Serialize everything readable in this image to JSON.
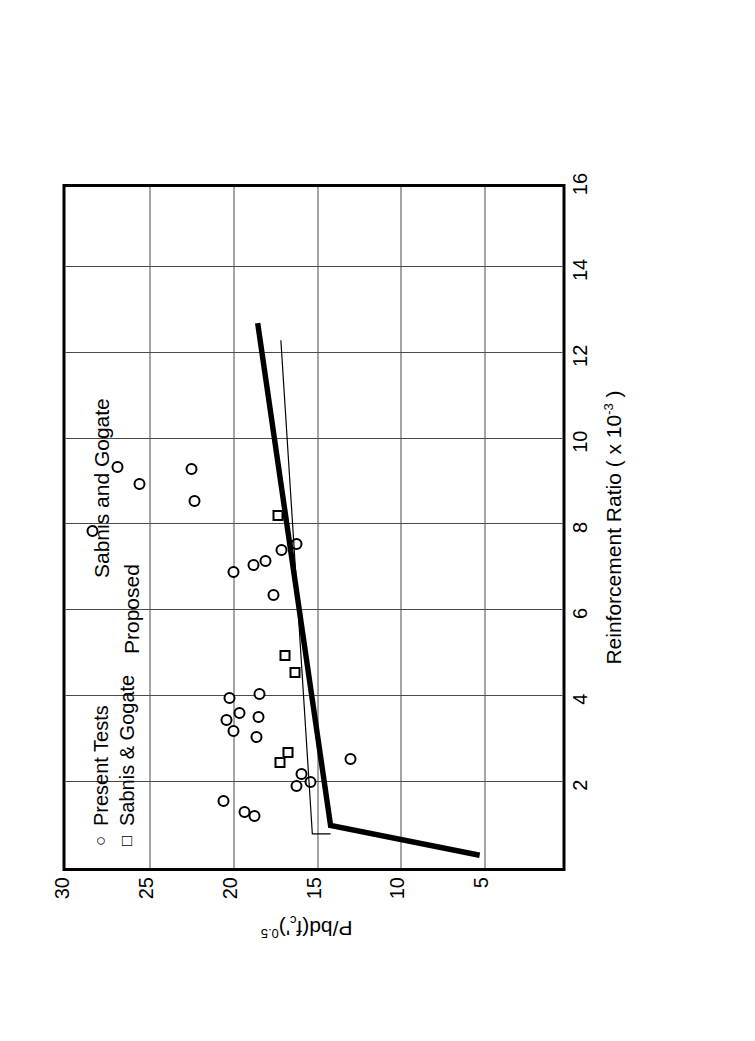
{
  "figure": {
    "orientation": "rotated-90-ccw"
  },
  "chart_data": {
    "type": "scatter",
    "title": "",
    "xlabel": "Reinforcement Ratio ( x 10",
    "xlabel_exponent": "-3",
    "xlabel_tail": " )",
    "ylabel": "P/bd(f",
    "ylabel_sub": "c",
    "ylabel_prime": "'",
    "ylabel_tail": ")",
    "ylabel_exp": "0.5",
    "xlim": [
      0,
      16
    ],
    "ylim": [
      0,
      30
    ],
    "xticks": [
      2,
      4,
      6,
      8,
      10,
      12,
      14,
      16
    ],
    "yticks": [
      5,
      10,
      15,
      20,
      25,
      30
    ],
    "grid": true,
    "legend_position": "top-left-inside",
    "series": [
      {
        "name": "Present Tests",
        "marker": "circle",
        "points": [
          [
            1.55,
            20.6
          ],
          [
            1.3,
            19.3
          ],
          [
            1.2,
            18.7
          ],
          [
            1.92,
            16.2
          ],
          [
            2.2,
            15.9
          ],
          [
            2.0,
            15.4
          ],
          [
            2.55,
            13.0
          ],
          [
            3.05,
            18.6
          ],
          [
            3.2,
            20.0
          ],
          [
            3.45,
            20.4
          ],
          [
            3.52,
            18.5
          ],
          [
            3.62,
            19.6
          ],
          [
            3.95,
            20.2
          ],
          [
            4.05,
            18.4
          ],
          [
            6.35,
            17.6
          ],
          [
            6.9,
            20.0
          ],
          [
            7.05,
            18.8
          ],
          [
            7.15,
            18.1
          ],
          [
            7.4,
            17.1
          ],
          [
            7.55,
            16.2
          ],
          [
            7.85,
            28.4
          ],
          [
            8.55,
            22.3
          ],
          [
            8.95,
            25.6
          ],
          [
            9.35,
            26.9
          ],
          [
            9.3,
            22.5
          ]
        ]
      },
      {
        "name": "Sabnis & Gogate",
        "marker": "square",
        "points": [
          [
            2.45,
            17.2
          ],
          [
            2.7,
            16.7
          ],
          [
            4.55,
            16.3
          ],
          [
            4.95,
            16.9
          ],
          [
            8.2,
            17.3
          ]
        ]
      }
    ],
    "lines": [
      {
        "name": "Proposed",
        "style": "thick-solid",
        "label": "Proposed",
        "vertices": [
          [
            0.3,
            5.0
          ],
          [
            1.0,
            14.0
          ],
          [
            12.8,
            18.4
          ]
        ]
      },
      {
        "name": "Sabnis and Gogate",
        "style": "thin-solid",
        "label": "Sabnis and Gogate",
        "vertices": [
          [
            0.8,
            14.0
          ],
          [
            0.8,
            15.1
          ],
          [
            12.4,
            17.0
          ]
        ]
      }
    ]
  },
  "legend": {
    "items": [
      {
        "marker": "○",
        "label": "Present Tests"
      },
      {
        "marker": "□",
        "label": "Sabnis & Gogate"
      }
    ]
  },
  "annotations": {
    "proposed": "Proposed",
    "sabnis_and_gogate": "Sabnis and Gogate"
  },
  "axis_text": {
    "x_title_main": "Reinforcement Ratio ( x 10",
    "x_title_sup": "-3",
    "x_title_end": " )",
    "x_tick_labels": [
      "2",
      "4",
      "6",
      "8",
      "10",
      "12",
      "14",
      "16"
    ],
    "y_tick_labels": [
      "5",
      "10",
      "15",
      "20",
      "25",
      "30"
    ]
  },
  "colors": {
    "ink": "#000000",
    "grid": "#4a4a4a",
    "background": "#ffffff"
  }
}
